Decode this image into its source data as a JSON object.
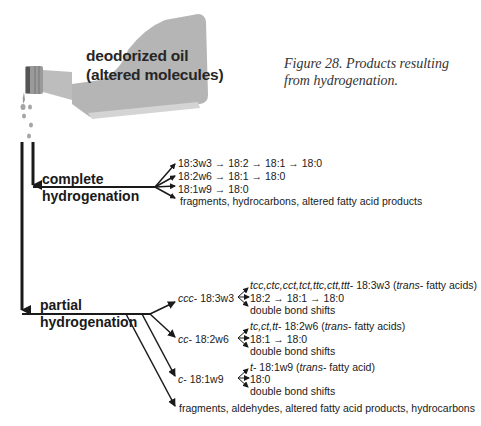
{
  "bottle": {
    "label_line1": "deodorized oil",
    "label_line2": "(altered molecules)",
    "fill_color": "#b3b3b3"
  },
  "caption": {
    "line1": "Figure 28. Products resulting",
    "line2": "from hydrogenation."
  },
  "complete": {
    "label_line1": "complete",
    "label_line2": "hydrogenation",
    "products": [
      "18:3w3 → 18:2 → 18:1 → 18:0",
      "18:2w6 → 18:1 → 18:0",
      "18:1w9 → 18:0",
      "fragments, hydrocarbons, altered fatty acid products"
    ]
  },
  "partial": {
    "label_line1": "partial",
    "label_line2": "hydrogenation",
    "groups": [
      {
        "prefix": "ccc",
        "name": "- 18:3w3",
        "trans_prefix": "tcc,ctc,cct,tct,ttc,ctt,ttt",
        "trans_rest": "- 18:3w3 (",
        "trans_word": "trans",
        "trans_tail": "- fatty acids)",
        "chain": "18:2 → 18:1 → 18:0",
        "shifts": "double bond shifts"
      },
      {
        "prefix": "cc",
        "name": "- 18:2w6",
        "trans_prefix": "tc,ct,tt",
        "trans_rest": "- 18:2w6 (",
        "trans_word": "trans",
        "trans_tail": "- fatty acids)",
        "chain": "18:1 → 18:0",
        "shifts": "double bond shifts"
      },
      {
        "prefix": "c",
        "name": "- 18:1w9",
        "trans_prefix": "t",
        "trans_rest": "- 18:1w9 (",
        "trans_word": "trans",
        "trans_tail": "- fatty acid)",
        "chain": "18:0",
        "shifts": "double bond shifts"
      }
    ],
    "other": "fragments, aldehydes, altered fatty acid products, hydrocarbons"
  }
}
